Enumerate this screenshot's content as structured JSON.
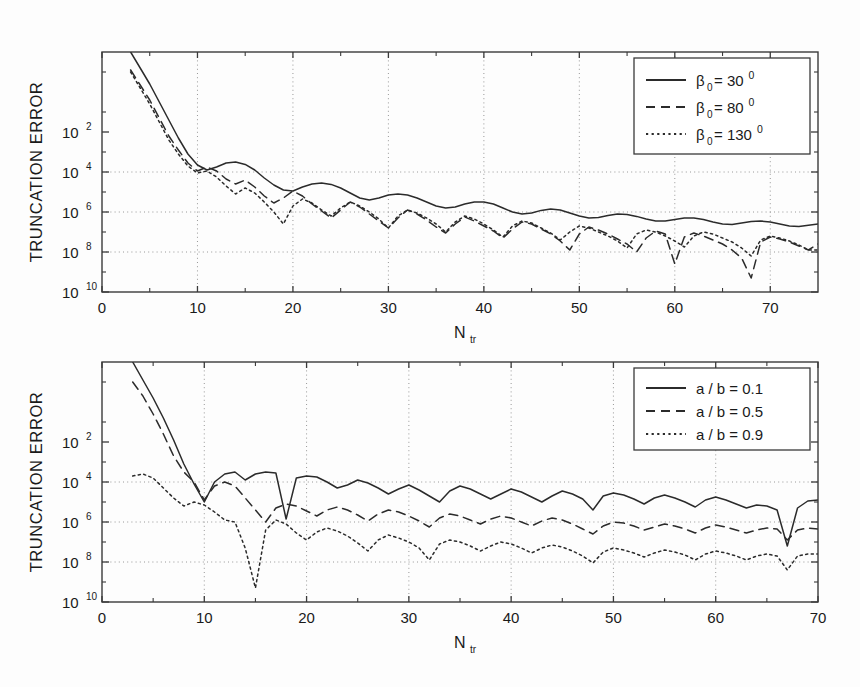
{
  "document": {
    "title": "Truncation error versus N_tr",
    "background_color": "#fdfdfd",
    "ink_color": "#2b2b2b"
  },
  "chart_data": [
    {
      "id": "top",
      "type": "line",
      "title": "",
      "xlabel": "N",
      "xlabel_sub": "tr",
      "ylabel": "TRUNCATION ERROR",
      "xlim": [
        0,
        75
      ],
      "ylim_exponents": [
        -10,
        2
      ],
      "yscale": "log",
      "grid": true,
      "grid_x_values": [
        10,
        20,
        30,
        40,
        50,
        60,
        70
      ],
      "grid_y_exponents": [
        -4,
        -6,
        -8
      ],
      "xticks": [
        0,
        10,
        20,
        30,
        40,
        50,
        60,
        70
      ],
      "xticklabels": [
        "0",
        "10",
        "20",
        "30",
        "40",
        "50",
        "60",
        "70"
      ],
      "yticks_mantissa": "10",
      "yticks_exponents": [
        "2",
        "4",
        "6",
        "8",
        "10"
      ],
      "ytick_exponent_values": [
        -2,
        -4,
        -6,
        -8,
        -10
      ],
      "legend_position": "upper-right",
      "series": [
        {
          "name": "beta0-30",
          "label_base": "β",
          "label_sub": "0",
          "label_mid": "= 30",
          "label_sup": "0",
          "style": "solid",
          "dash": "",
          "x": [
            3,
            4,
            5,
            6,
            7,
            8,
            9,
            10,
            11,
            12,
            13,
            14,
            15,
            16,
            17,
            18,
            19,
            20,
            21,
            22,
            23,
            24,
            25,
            26,
            27,
            28,
            29,
            30,
            31,
            32,
            33,
            34,
            35,
            36,
            37,
            38,
            39,
            40,
            41,
            42,
            43,
            44,
            45,
            46,
            47,
            48,
            49,
            50,
            51,
            52,
            53,
            54,
            55,
            56,
            57,
            58,
            59,
            60,
            61,
            62,
            63,
            64,
            65,
            66,
            67,
            68,
            69,
            70,
            71,
            72,
            73,
            74,
            75
          ],
          "logy": [
            2.0,
            1.2,
            0.4,
            -0.5,
            -1.4,
            -2.3,
            -3.1,
            -3.65,
            -3.9,
            -3.75,
            -3.55,
            -3.5,
            -3.62,
            -3.9,
            -4.3,
            -4.65,
            -4.9,
            -4.95,
            -4.75,
            -4.6,
            -4.55,
            -4.62,
            -4.8,
            -5.05,
            -5.3,
            -5.4,
            -5.3,
            -5.15,
            -5.1,
            -5.15,
            -5.3,
            -5.5,
            -5.7,
            -5.8,
            -5.75,
            -5.6,
            -5.5,
            -5.5,
            -5.6,
            -5.8,
            -6.0,
            -6.1,
            -6.05,
            -5.92,
            -5.85,
            -5.9,
            -6.05,
            -6.2,
            -6.3,
            -6.28,
            -6.18,
            -6.1,
            -6.12,
            -6.22,
            -6.35,
            -6.45,
            -6.45,
            -6.38,
            -6.3,
            -6.3,
            -6.38,
            -6.5,
            -6.6,
            -6.62,
            -6.55,
            -6.48,
            -6.45,
            -6.5,
            -6.6,
            -6.7,
            -6.72,
            -6.66,
            -6.6
          ]
        },
        {
          "name": "beta0-80",
          "label_base": "β",
          "label_sub": "0",
          "label_mid": "= 80",
          "label_sup": "0",
          "style": "dashed",
          "dash": "9 6",
          "x": [
            3,
            4,
            5,
            6,
            7,
            8,
            9,
            10,
            11,
            12,
            13,
            14,
            15,
            16,
            17,
            18,
            19,
            20,
            21,
            22,
            23,
            24,
            25,
            26,
            27,
            28,
            29,
            30,
            31,
            32,
            33,
            34,
            35,
            36,
            37,
            38,
            39,
            40,
            41,
            42,
            43,
            44,
            45,
            46,
            47,
            48,
            49,
            50,
            51,
            52,
            53,
            54,
            55,
            56,
            57,
            58,
            59,
            60,
            61,
            62,
            63,
            64,
            65,
            66,
            67,
            68,
            69,
            70,
            71,
            72,
            73,
            74,
            75
          ],
          "logy": [
            1.1,
            0.35,
            -0.4,
            -1.3,
            -2.2,
            -2.9,
            -3.55,
            -3.95,
            -3.75,
            -3.95,
            -4.35,
            -4.6,
            -4.4,
            -4.75,
            -5.2,
            -5.55,
            -5.3,
            -4.95,
            -5.2,
            -5.6,
            -5.95,
            -6.3,
            -5.9,
            -5.5,
            -5.75,
            -6.1,
            -6.45,
            -6.8,
            -6.3,
            -5.9,
            -6.1,
            -6.4,
            -6.75,
            -7.05,
            -6.6,
            -6.25,
            -6.45,
            -6.7,
            -6.95,
            -7.3,
            -6.85,
            -6.5,
            -6.6,
            -6.85,
            -7.1,
            -7.45,
            -7.9,
            -7.1,
            -6.75,
            -6.9,
            -7.1,
            -7.35,
            -7.6,
            -8.0,
            -7.3,
            -6.95,
            -7.1,
            -8.6,
            -7.25,
            -7.05,
            -7.2,
            -7.4,
            -7.6,
            -7.9,
            -8.3,
            -9.3,
            -7.5,
            -7.25,
            -7.35,
            -7.5,
            -7.7,
            -7.9,
            -7.6
          ]
        },
        {
          "name": "beta0-130",
          "label_base": "β",
          "label_sub": "0",
          "label_mid": "= 130",
          "label_sup": "0",
          "style": "dotted",
          "dash": "2.2 3.4",
          "x": [
            3,
            4,
            5,
            6,
            7,
            8,
            9,
            10,
            11,
            12,
            13,
            14,
            15,
            16,
            17,
            18,
            19,
            20,
            21,
            22,
            23,
            24,
            25,
            26,
            27,
            28,
            29,
            30,
            31,
            32,
            33,
            34,
            35,
            36,
            37,
            38,
            39,
            40,
            41,
            42,
            43,
            44,
            45,
            46,
            47,
            48,
            49,
            50,
            51,
            52,
            53,
            54,
            55,
            56,
            57,
            58,
            59,
            60,
            61,
            62,
            63,
            64,
            65,
            66,
            67,
            68,
            69,
            70,
            71,
            72,
            73,
            74,
            75
          ],
          "logy": [
            1.0,
            0.2,
            -0.6,
            -1.5,
            -2.4,
            -3.1,
            -3.7,
            -4.05,
            -3.95,
            -4.25,
            -4.7,
            -5.1,
            -4.8,
            -5.05,
            -5.5,
            -6.0,
            -6.6,
            -5.7,
            -5.35,
            -5.55,
            -5.9,
            -6.2,
            -5.8,
            -5.5,
            -5.7,
            -6.0,
            -6.35,
            -6.8,
            -6.2,
            -5.9,
            -6.05,
            -6.3,
            -6.6,
            -7.0,
            -6.5,
            -6.2,
            -6.35,
            -6.6,
            -6.9,
            -7.25,
            -6.7,
            -6.45,
            -6.55,
            -6.8,
            -7.05,
            -7.4,
            -7.0,
            -6.7,
            -6.8,
            -7.0,
            -7.2,
            -7.45,
            -7.8,
            -7.1,
            -6.9,
            -7.0,
            -7.2,
            -7.45,
            -7.75,
            -7.2,
            -7.0,
            -7.1,
            -7.3,
            -7.5,
            -7.8,
            -8.2,
            -7.4,
            -7.2,
            -7.3,
            -7.45,
            -7.65,
            -7.9,
            -7.9
          ]
        }
      ]
    },
    {
      "id": "bottom",
      "type": "line",
      "title": "",
      "xlabel": "N",
      "xlabel_sub": "tr",
      "ylabel": "TRUNCATION ERROR",
      "xlim": [
        0,
        70
      ],
      "ylim_exponents": [
        -10,
        2
      ],
      "yscale": "log",
      "grid": true,
      "grid_x_values": [
        10,
        20,
        30,
        40,
        50,
        60
      ],
      "grid_y_exponents": [
        -4,
        -6,
        -8
      ],
      "xticks": [
        0,
        10,
        20,
        30,
        40,
        50,
        60,
        70
      ],
      "xticklabels": [
        "0",
        "10",
        "20",
        "30",
        "40",
        "50",
        "60",
        "70"
      ],
      "yticks_mantissa": "10",
      "yticks_exponents": [
        "2",
        "4",
        "6",
        "8",
        "10"
      ],
      "ytick_exponent_values": [
        -2,
        -4,
        -6,
        -8,
        -10
      ],
      "legend_position": "upper-right",
      "series": [
        {
          "name": "ab-0.1",
          "label": "a / b = 0.1",
          "style": "solid",
          "dash": "",
          "x": [
            3,
            4,
            5,
            6,
            7,
            8,
            9,
            10,
            11,
            12,
            13,
            14,
            15,
            16,
            17,
            18,
            19,
            20,
            21,
            22,
            23,
            24,
            25,
            26,
            27,
            28,
            29,
            30,
            31,
            32,
            33,
            34,
            35,
            36,
            37,
            38,
            39,
            40,
            41,
            42,
            43,
            44,
            45,
            46,
            47,
            48,
            49,
            50,
            51,
            52,
            53,
            54,
            55,
            56,
            57,
            58,
            59,
            60,
            61,
            62,
            63,
            64,
            65,
            66,
            67,
            68,
            69,
            70
          ],
          "logy": [
            2.0,
            1.1,
            0.2,
            -0.8,
            -1.9,
            -3.1,
            -4.1,
            -5.0,
            -4.0,
            -3.6,
            -3.5,
            -3.9,
            -3.6,
            -3.5,
            -3.55,
            -5.85,
            -3.8,
            -3.7,
            -3.75,
            -4.0,
            -4.3,
            -4.15,
            -3.9,
            -4.05,
            -4.3,
            -4.6,
            -4.35,
            -4.15,
            -4.4,
            -4.7,
            -5.0,
            -4.45,
            -4.2,
            -4.35,
            -4.6,
            -4.85,
            -4.6,
            -4.35,
            -4.5,
            -4.75,
            -5.0,
            -4.7,
            -4.45,
            -4.6,
            -4.85,
            -5.4,
            -4.7,
            -4.55,
            -4.65,
            -4.85,
            -5.1,
            -4.8,
            -4.65,
            -4.8,
            -5.0,
            -5.25,
            -4.9,
            -4.75,
            -4.9,
            -5.1,
            -5.3,
            -5.15,
            -5.2,
            -5.4,
            -7.2,
            -5.3,
            -4.95,
            -4.9
          ]
        },
        {
          "name": "ab-0.5",
          "label": "a / b = 0.5",
          "style": "dashed",
          "dash": "9 6",
          "x": [
            3,
            4,
            5,
            6,
            7,
            8,
            9,
            10,
            11,
            12,
            13,
            14,
            15,
            16,
            17,
            18,
            19,
            20,
            21,
            22,
            23,
            24,
            25,
            26,
            27,
            28,
            29,
            30,
            31,
            32,
            33,
            34,
            35,
            36,
            37,
            38,
            39,
            40,
            41,
            42,
            43,
            44,
            45,
            46,
            47,
            48,
            49,
            50,
            51,
            52,
            53,
            54,
            55,
            56,
            57,
            58,
            59,
            60,
            61,
            62,
            63,
            64,
            65,
            66,
            67,
            68,
            69,
            70
          ],
          "logy": [
            1.0,
            0.3,
            -0.6,
            -1.6,
            -2.7,
            -3.5,
            -4.0,
            -4.9,
            -4.2,
            -4.0,
            -4.2,
            -4.8,
            -5.4,
            -6.0,
            -5.3,
            -5.1,
            -5.2,
            -5.45,
            -5.7,
            -5.4,
            -5.25,
            -5.4,
            -5.65,
            -5.95,
            -5.6,
            -5.4,
            -5.5,
            -5.7,
            -5.95,
            -6.25,
            -5.8,
            -5.6,
            -5.7,
            -5.9,
            -6.1,
            -5.85,
            -5.7,
            -5.8,
            -6.0,
            -6.2,
            -5.95,
            -5.8,
            -5.9,
            -6.1,
            -6.35,
            -6.6,
            -6.2,
            -6.0,
            -6.05,
            -6.2,
            -6.4,
            -6.25,
            -6.1,
            -6.2,
            -6.35,
            -6.55,
            -6.3,
            -6.15,
            -6.25,
            -6.4,
            -6.55,
            -6.4,
            -6.3,
            -6.35,
            -6.9,
            -6.4,
            -6.3,
            -6.35
          ]
        },
        {
          "name": "ab-0.9",
          "label": "a / b = 0.9",
          "style": "dotted",
          "dash": "2.2 3.4",
          "x": [
            3,
            4,
            5,
            6,
            7,
            8,
            9,
            10,
            11,
            12,
            13,
            14,
            15,
            16,
            17,
            18,
            19,
            20,
            21,
            22,
            23,
            24,
            25,
            26,
            27,
            28,
            29,
            30,
            31,
            32,
            33,
            34,
            35,
            36,
            37,
            38,
            39,
            40,
            41,
            42,
            43,
            44,
            45,
            46,
            47,
            48,
            49,
            50,
            51,
            52,
            53,
            54,
            55,
            56,
            57,
            58,
            59,
            60,
            61,
            62,
            63,
            64,
            65,
            66,
            67,
            68,
            69,
            70
          ],
          "logy": [
            -3.7,
            -3.6,
            -3.8,
            -4.3,
            -4.8,
            -5.2,
            -5.0,
            -5.15,
            -5.5,
            -5.9,
            -6.0,
            -7.3,
            -9.3,
            -6.4,
            -5.9,
            -6.1,
            -6.55,
            -6.9,
            -6.5,
            -6.3,
            -6.45,
            -6.7,
            -7.05,
            -7.45,
            -6.9,
            -6.65,
            -6.8,
            -7.0,
            -7.3,
            -7.9,
            -7.1,
            -6.9,
            -7.0,
            -7.2,
            -7.45,
            -7.2,
            -7.0,
            -7.1,
            -7.3,
            -7.55,
            -7.3,
            -7.15,
            -7.25,
            -7.45,
            -7.7,
            -8.05,
            -7.5,
            -7.3,
            -7.4,
            -7.55,
            -7.75,
            -7.55,
            -7.4,
            -7.5,
            -7.65,
            -7.9,
            -7.6,
            -7.45,
            -7.55,
            -7.7,
            -7.9,
            -7.7,
            -7.6,
            -7.7,
            -8.4,
            -7.7,
            -7.6,
            -7.6
          ]
        }
      ]
    }
  ]
}
